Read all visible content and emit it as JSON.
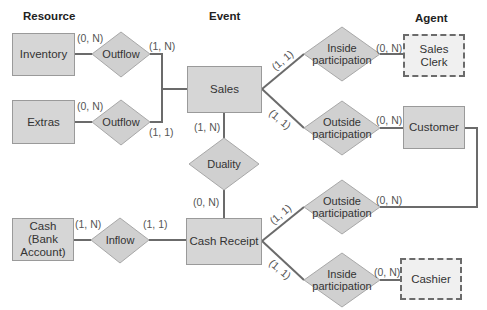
{
  "headers": {
    "resource": "Resource",
    "event": "Event",
    "agent": "Agent"
  },
  "entities": {
    "inventory": "Inventory",
    "extras": "Extras",
    "cash_line1": "Cash",
    "cash_line2": "(Bank",
    "cash_line3": "Account)",
    "sales": "Sales",
    "cash_receipt": "Cash Receipt",
    "sales_clerk": "Sales Clerk",
    "customer": "Customer",
    "cashier": "Cashier"
  },
  "relationships": {
    "outflow_1": "Outflow",
    "outflow_2": "Outflow",
    "inflow": "Inflow",
    "duality": "Duality",
    "inside_sales_l1": "Inside",
    "inside_sales_l2": "participation",
    "outside_sales_l1": "Outside",
    "outside_sales_l2": "participation",
    "outside_cash_l1": "Outside",
    "outside_cash_l2": "participation",
    "inside_cash_l1": "Inside",
    "inside_cash_l2": "participation"
  },
  "cardinalities": {
    "inventory_outflow": "(0, N)",
    "outflow1_sales": "(1, N)",
    "extras_outflow": "(0, N)",
    "outflow2_sales": "(1, 1)",
    "sales_duality": "(1, N)",
    "duality_cashreceipt": "(0, N)",
    "cash_inflow": "(1, N)",
    "inflow_cashreceipt": "(1, 1)",
    "sales_inside": "(1, 1)",
    "inside_salesclerk": "(0, N)",
    "sales_outside": "(1, 1)",
    "outside_customer": "(0, N)",
    "cashreceipt_outside": "(1, 1)",
    "outside_customer_2": "(0, N)",
    "cashreceipt_inside": "(1, 1)",
    "inside_cashier": "(0, N)"
  },
  "colors": {
    "entity_fill": "#d6d6d6",
    "diamond_fill": "#d0d0d0",
    "line": "#6b6b6b",
    "agent_dashed_fill": "#f0f0f0"
  }
}
